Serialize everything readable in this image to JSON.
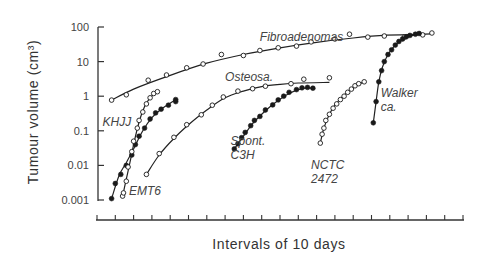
{
  "chart_data": {
    "type": "line",
    "title": "",
    "xlabel": "Intervals of 10 days",
    "ylabel": "Tumour volume (cm³)",
    "yscale": "log",
    "ylim": [
      0.001,
      100
    ],
    "xlim": [
      0,
      20
    ],
    "x_tick_count": 21,
    "x_tick_labels": [],
    "y_ticks": [
      100,
      10,
      1,
      0.1,
      0.01,
      0.001
    ],
    "y_tick_labels": [
      "100",
      "10",
      "1",
      "0.1",
      "0.01",
      "0.001"
    ],
    "grid": false,
    "legend": "inline labels",
    "series": [
      {
        "name": "Fibroadenomas",
        "marker": "open",
        "label_pos": [
          8.9,
          40
        ],
        "points": [
          [
            0.8,
            0.77
          ],
          [
            1.6,
            1.1
          ],
          [
            2.8,
            2.9
          ],
          [
            3.8,
            4.1
          ],
          [
            4.9,
            6.6
          ],
          [
            5.8,
            8.5
          ],
          [
            6.8,
            16
          ],
          [
            8.0,
            15
          ],
          [
            8.9,
            21
          ],
          [
            9.9,
            25
          ],
          [
            10.9,
            28
          ],
          [
            11.7,
            37
          ],
          [
            13.0,
            45
          ],
          [
            13.8,
            62
          ],
          [
            14.8,
            51
          ],
          [
            15.7,
            55
          ],
          [
            16.8,
            51
          ],
          [
            17.8,
            59
          ],
          [
            18.3,
            67
          ]
        ],
        "curve": [
          [
            0.8,
            0.77
          ],
          [
            2,
            1.6
          ],
          [
            4,
            4
          ],
          [
            6,
            9
          ],
          [
            8,
            16
          ],
          [
            10,
            25
          ],
          [
            12,
            36
          ],
          [
            14,
            48
          ],
          [
            15.8,
            58
          ],
          [
            17,
            60
          ],
          [
            18.3,
            63
          ]
        ]
      },
      {
        "name": "Osteosa.",
        "marker": "open",
        "label_pos": [
          7.0,
          2.8
        ],
        "points": [
          [
            2.7,
            0.0055
          ],
          [
            3.4,
            0.022
          ],
          [
            4.2,
            0.065
          ],
          [
            4.9,
            0.15
          ],
          [
            5.7,
            0.29
          ],
          [
            6.3,
            0.55
          ],
          [
            6.9,
            0.95
          ],
          [
            7.7,
            1.4
          ],
          [
            8.5,
            1.65
          ],
          [
            9.2,
            1.95
          ],
          [
            10.6,
            2.3
          ],
          [
            11.3,
            3.1
          ],
          [
            12.7,
            3.4
          ]
        ],
        "curve": [
          [
            2.7,
            0.0055
          ],
          [
            3.4,
            0.02
          ],
          [
            4.2,
            0.06
          ],
          [
            5,
            0.15
          ],
          [
            6,
            0.4
          ],
          [
            7,
            0.9
          ],
          [
            8,
            1.4
          ],
          [
            9,
            1.9
          ],
          [
            10,
            2.2
          ],
          [
            11,
            2.4
          ],
          [
            12.7,
            2.5
          ]
        ]
      },
      {
        "name": "KHJJ",
        "marker": "filled",
        "label_pos": [
          0.3,
          0.14
        ],
        "points": [
          [
            0.8,
            0.0011
          ],
          [
            1.0,
            0.003
          ],
          [
            1.3,
            0.0055
          ],
          [
            1.6,
            0.01
          ],
          [
            1.9,
            0.02
          ],
          [
            2.1,
            0.04
          ],
          [
            2.3,
            0.07
          ],
          [
            2.6,
            0.12
          ],
          [
            2.9,
            0.22
          ],
          [
            3.2,
            0.33
          ],
          [
            3.5,
            0.42
          ],
          [
            3.9,
            0.55
          ],
          [
            4.3,
            0.7
          ],
          [
            4.3,
            0.8
          ]
        ],
        "curve": [
          [
            0.8,
            0.0011
          ],
          [
            1.2,
            0.005
          ],
          [
            1.6,
            0.012
          ],
          [
            2,
            0.03
          ],
          [
            2.5,
            0.1
          ],
          [
            3,
            0.24
          ],
          [
            3.5,
            0.42
          ],
          [
            4.3,
            0.8
          ]
        ]
      },
      {
        "name": "EMT6",
        "marker": "open",
        "label_pos": [
          1.75,
          0.0014
        ],
        "points": [
          [
            1.4,
            0.0013
          ],
          [
            1.45,
            0.0016
          ],
          [
            1.6,
            0.0035
          ],
          [
            1.7,
            0.009
          ],
          [
            1.9,
            0.025
          ],
          [
            2.0,
            0.05
          ],
          [
            2.2,
            0.12
          ],
          [
            2.3,
            0.2
          ],
          [
            2.5,
            0.35
          ],
          [
            2.7,
            0.6
          ],
          [
            2.9,
            0.9
          ],
          [
            3.1,
            1.2
          ],
          [
            3.3,
            1.35
          ]
        ],
        "curve": [
          [
            1.4,
            0.0013
          ],
          [
            1.6,
            0.004
          ],
          [
            1.8,
            0.012
          ],
          [
            2,
            0.04
          ],
          [
            2.3,
            0.18
          ],
          [
            2.6,
            0.5
          ],
          [
            2.9,
            0.9
          ],
          [
            3.3,
            1.4
          ]
        ]
      },
      {
        "name": "Spont. C3H",
        "marker": "filled",
        "label_pos": [
          7.3,
          0.038
        ],
        "points": [
          [
            7.5,
            0.03
          ],
          [
            7.7,
            0.042
          ],
          [
            7.9,
            0.063
          ],
          [
            8.1,
            0.09
          ],
          [
            8.4,
            0.14
          ],
          [
            8.6,
            0.2
          ],
          [
            8.9,
            0.26
          ],
          [
            9.2,
            0.4
          ],
          [
            9.6,
            0.56
          ],
          [
            9.9,
            0.78
          ],
          [
            10.2,
            1.0
          ],
          [
            10.5,
            1.3
          ],
          [
            10.9,
            1.55
          ],
          [
            11.2,
            1.75
          ],
          [
            11.5,
            1.8
          ],
          [
            11.8,
            1.7
          ]
        ],
        "curve": [
          [
            7.5,
            0.03
          ],
          [
            8,
            0.07
          ],
          [
            8.5,
            0.16
          ],
          [
            9,
            0.3
          ],
          [
            9.5,
            0.52
          ],
          [
            10,
            0.82
          ],
          [
            10.5,
            1.2
          ],
          [
            11,
            1.55
          ],
          [
            11.5,
            1.75
          ],
          [
            11.8,
            1.7
          ]
        ]
      },
      {
        "name": "NCTC 2472",
        "marker": "open",
        "label_pos": [
          11.7,
          0.008
        ],
        "points": [
          [
            12.2,
            0.044
          ],
          [
            12.3,
            0.08
          ],
          [
            12.4,
            0.12
          ],
          [
            12.5,
            0.2
          ],
          [
            12.7,
            0.3
          ],
          [
            12.9,
            0.45
          ],
          [
            13.1,
            0.6
          ],
          [
            13.3,
            0.8
          ],
          [
            13.5,
            1.0
          ],
          [
            13.7,
            1.3
          ],
          [
            13.9,
            1.6
          ],
          [
            14.1,
            2.0
          ],
          [
            14.3,
            2.3
          ],
          [
            14.6,
            2.6
          ]
        ],
        "curve": [
          [
            12.2,
            0.044
          ],
          [
            12.4,
            0.12
          ],
          [
            12.7,
            0.3
          ],
          [
            13,
            0.55
          ],
          [
            13.4,
            0.95
          ],
          [
            13.8,
            1.5
          ],
          [
            14.2,
            2.1
          ],
          [
            14.6,
            2.6
          ]
        ]
      },
      {
        "name": "Walker ca.",
        "marker": "filled",
        "label_pos": [
          15.5,
          0.95
        ],
        "points": [
          [
            15.1,
            0.17
          ],
          [
            15.25,
            0.7
          ],
          [
            15.4,
            2.6
          ],
          [
            15.55,
            5.5
          ],
          [
            15.7,
            10
          ],
          [
            15.9,
            16
          ],
          [
            16.1,
            22
          ],
          [
            16.3,
            30
          ],
          [
            16.5,
            38
          ],
          [
            16.7,
            45
          ],
          [
            16.9,
            52
          ],
          [
            17.1,
            57
          ],
          [
            17.4,
            62
          ],
          [
            17.6,
            65
          ]
        ],
        "curve": [
          [
            15.1,
            0.17
          ],
          [
            15.25,
            0.7
          ],
          [
            15.4,
            2.6
          ],
          [
            15.6,
            7
          ],
          [
            15.9,
            16
          ],
          [
            16.3,
            30
          ],
          [
            16.8,
            48
          ],
          [
            17.6,
            65
          ]
        ]
      }
    ]
  }
}
